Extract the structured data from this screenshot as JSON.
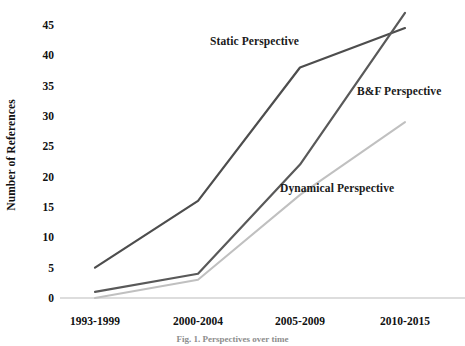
{
  "chart_data": {
    "type": "line",
    "title": "",
    "xlabel": "",
    "ylabel": "Number of References",
    "categories": [
      "1993-1999",
      "2000-2004",
      "2005-2009",
      "2010-2015"
    ],
    "ylim": [
      0,
      47
    ],
    "yticks": [
      0,
      5,
      10,
      15,
      20,
      25,
      30,
      35,
      40,
      45
    ],
    "grid": false,
    "legend_position": "inline-annotations",
    "series": [
      {
        "name": "Static Perspective",
        "values": [
          5,
          16,
          38,
          44.5
        ],
        "color": "#4d4d4d"
      },
      {
        "name": "B&F Perspective",
        "values": [
          1,
          4,
          22,
          47
        ],
        "color": "#595959"
      },
      {
        "name": "Dynamical Perspective",
        "values": [
          0,
          3,
          17,
          29
        ],
        "color": "#c0c0c0"
      }
    ],
    "annotations": [
      {
        "text": "Static Perspective"
      },
      {
        "text": "B&F Perspective"
      },
      {
        "text": "Dynamical Perspective"
      }
    ]
  },
  "axis": {
    "y_title": "Number of References",
    "y_tick_labels": [
      "45",
      "40",
      "35",
      "30",
      "25",
      "20",
      "15",
      "10",
      "5",
      "0"
    ],
    "x_tick_labels": [
      "1993-1999",
      "2000-2004",
      "2005-2009",
      "2010-2015"
    ]
  },
  "caption": {
    "text": "Fig. 1. Perspectives over time"
  },
  "colors": {
    "static_line": "#4d4d4d",
    "bf_line": "#595959",
    "dynamical_line": "#c0c0c0",
    "baseline": "#d2d2d2",
    "text": "#111111",
    "background": "#ffffff"
  }
}
